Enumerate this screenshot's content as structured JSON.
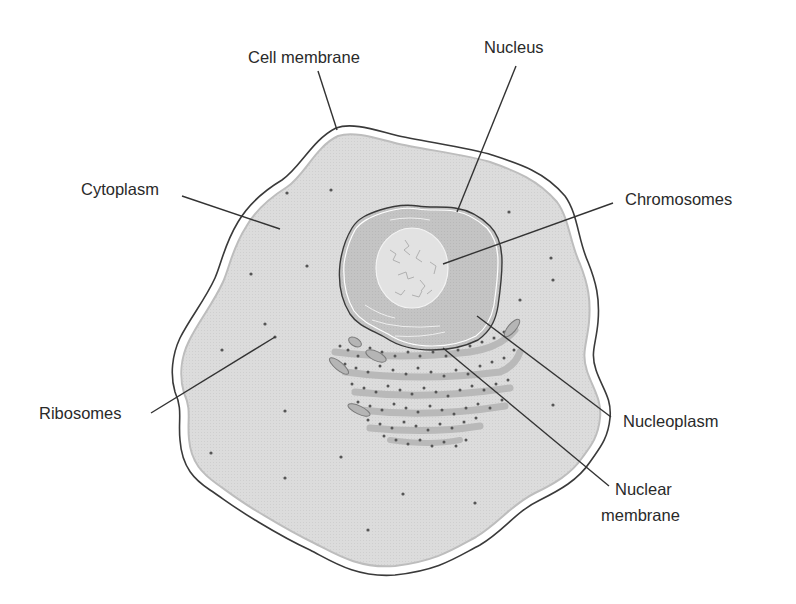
{
  "diagram": {
    "type": "labeled-illustration",
    "labels": {
      "cell_membrane": "Cell membrane",
      "nucleus": "Nucleus",
      "cytoplasm": "Cytoplasm",
      "chromosomes": "Chromosomes",
      "ribosomes": "Ribosomes",
      "nucleoplasm": "Nucleoplasm",
      "nuclear_membrane_line1": "Nuclear",
      "nuclear_membrane_line2": "membrane"
    },
    "colors": {
      "background": "#ffffff",
      "cytoplasm_fill": "#dcdcdc",
      "cytoplasm_edge": "#bdbdbd",
      "membrane_stroke": "#3a3a3a",
      "nucleoplasm_fill": "#c4c4c4",
      "chromatin_fill": "#e2e2e2",
      "er_fill": "#b9b9b9",
      "ribosome_dot": "#555555",
      "leader_line": "#333333",
      "label_text": "#2a2a2a"
    }
  }
}
